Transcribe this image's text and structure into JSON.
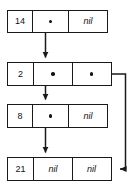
{
  "diagram": {
    "kind": "node-pointer-diagram",
    "colors": {
      "stroke": "#1a1a1a",
      "fill": "#ffffff",
      "text": "#111111"
    },
    "nil_label": "nil",
    "nodes": [
      {
        "id": "node-14",
        "key": "14",
        "x": 7,
        "y": 10,
        "width": 101,
        "height": 23,
        "cells": [
          {
            "name": "key-cell",
            "type": "key",
            "text": "14",
            "width": 25
          },
          {
            "name": "left-pointer-cell",
            "type": "pointer",
            "text": "",
            "width": 36
          },
          {
            "name": "right-pointer-cell",
            "type": "nil",
            "text": "nil",
            "width": 40
          }
        ]
      },
      {
        "id": "node-2",
        "key": "2",
        "x": 7,
        "y": 62,
        "width": 105,
        "height": 24,
        "cells": [
          {
            "name": "key-cell",
            "type": "key",
            "text": "2",
            "width": 26
          },
          {
            "name": "left-pointer-cell",
            "type": "pointer",
            "text": "",
            "width": 39
          },
          {
            "name": "right-pointer-cell",
            "type": "pointer",
            "text": "",
            "width": 40
          }
        ]
      },
      {
        "id": "node-8",
        "key": "8",
        "x": 7,
        "y": 104,
        "width": 101,
        "height": 24,
        "cells": [
          {
            "name": "key-cell",
            "type": "key",
            "text": "8",
            "width": 25
          },
          {
            "name": "left-pointer-cell",
            "type": "pointer",
            "text": "",
            "width": 36
          },
          {
            "name": "right-pointer-cell",
            "type": "nil",
            "text": "nil",
            "width": 40
          }
        ]
      },
      {
        "id": "node-21",
        "key": "21",
        "x": 7,
        "y": 157,
        "width": 105,
        "height": 24,
        "cells": [
          {
            "name": "key-cell",
            "type": "key",
            "text": "21",
            "width": 26
          },
          {
            "name": "left-pointer-cell",
            "type": "nil",
            "text": "nil",
            "width": 39
          },
          {
            "name": "right-pointer-cell",
            "type": "nil",
            "text": "nil",
            "width": 40
          }
        ]
      }
    ],
    "edges": [
      {
        "name": "edge-14-to-2",
        "from": "node-14",
        "to": "node-2",
        "style": "straight-down"
      },
      {
        "name": "edge-2-to-8",
        "from": "node-2",
        "to": "node-8",
        "style": "straight-down"
      },
      {
        "name": "edge-8-to-21",
        "from": "node-8",
        "to": "node-21",
        "style": "straight-down"
      },
      {
        "name": "edge-2-right-to-21",
        "from": "node-2",
        "to": "node-21",
        "style": "right-down-left-elbow"
      }
    ]
  }
}
